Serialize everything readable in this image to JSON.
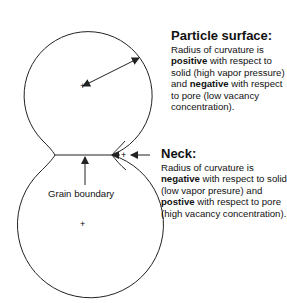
{
  "diagram": {
    "particle_surface": {
      "title": "Particle surface:",
      "t1": "Radius of curvature is ",
      "b1": "positive",
      "t2": " with respect to solid (high vapor pressure) and ",
      "b2": "negative",
      "t3": " with respect to pore (low vacancy concentration)."
    },
    "neck": {
      "title": "Neck:",
      "t1": "Radius of curvature is ",
      "b1": "negative",
      "t2": " with respect to solid (low vapor presure) and ",
      "b2": "postive",
      "t3": " with respect to pore (high vacancy concentration)."
    },
    "grain_boundary_label": "Grain boundary",
    "markers": {
      "plus": "+"
    },
    "colors": {
      "stroke": "#222222",
      "text": "#111111"
    }
  }
}
